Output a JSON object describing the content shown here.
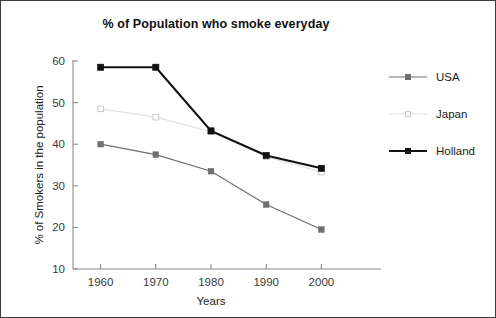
{
  "chart_data": {
    "type": "line",
    "title": "% of Population who smoke everyday",
    "xlabel": "Years",
    "ylabel": "% of Smokers in the population",
    "categories": [
      "1960",
      "1970",
      "1980",
      "1990",
      "2000"
    ],
    "x": [
      1960,
      1970,
      1980,
      1990,
      2000
    ],
    "xlim": [
      1955,
      2005
    ],
    "ylim": [
      10,
      60
    ],
    "yticks": [
      10,
      20,
      30,
      40,
      50,
      60
    ],
    "xticks": [
      "1960",
      "1970",
      "1980",
      "1990",
      "2000"
    ],
    "grid": false,
    "legend_position": "right",
    "series": [
      {
        "name": "USA",
        "color": "#707070",
        "marker": "filled-square",
        "values": [
          40.0,
          37.5,
          33.5,
          25.5,
          19.5
        ]
      },
      {
        "name": "Japan",
        "color": "#e2e2e2",
        "marker": "open-square",
        "values": [
          48.5,
          46.5,
          43.0,
          37.0,
          33.3
        ]
      },
      {
        "name": "Holland",
        "color": "#111111",
        "marker": "filled-square",
        "values": [
          58.5,
          58.5,
          43.2,
          37.3,
          34.2
        ]
      }
    ]
  },
  "legend": {
    "items": [
      {
        "label": "USA"
      },
      {
        "label": "Japan"
      },
      {
        "label": "Holland"
      }
    ]
  },
  "colors": {
    "usa": "#707070",
    "japan": "#e2e2e2",
    "holland": "#111111",
    "axis": "#8a8a8a",
    "border": "#3c3c3c",
    "title": "#111111"
  }
}
